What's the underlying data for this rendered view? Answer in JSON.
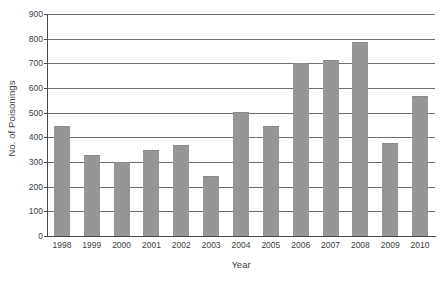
{
  "chart_data": {
    "type": "bar",
    "title": "",
    "subtitle": "",
    "xlabel": "Year",
    "ylabel": "No. of Poisonings",
    "categories": [
      "1998",
      "1999",
      "2000",
      "2001",
      "2002",
      "2003",
      "2004",
      "2005",
      "2006",
      "2007",
      "2008",
      "2009",
      "2010"
    ],
    "values": [
      447,
      330,
      298,
      350,
      370,
      242,
      503,
      445,
      703,
      715,
      785,
      378,
      568
    ],
    "ylim": [
      0,
      900
    ],
    "ytick_step": 100,
    "ytick_labels": [
      "900",
      "800",
      "700",
      "600",
      "500",
      "400",
      "300",
      "200",
      "100",
      "0"
    ],
    "grid": "horizontal",
    "legend": "none",
    "series": [
      {
        "name": "No. of Poisonings",
        "values": [
          447,
          330,
          298,
          350,
          370,
          242,
          503,
          445,
          703,
          715,
          785,
          378,
          568
        ]
      }
    ],
    "colors": {
      "bar": "#969696",
      "gridline": "#6e6e6e",
      "axis": "#4a4a4a",
      "text": "#3d3d3d",
      "background": "#ffffff"
    }
  }
}
